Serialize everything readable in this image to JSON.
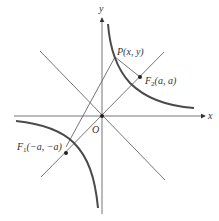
{
  "diagram": {
    "type": "hyperbola xy = c with foci on line y = x",
    "axes": {
      "x_label": "x",
      "y_label": "y",
      "origin_label": "O"
    },
    "points": {
      "P": {
        "label": "P(x,  y)"
      },
      "F2": {
        "name": "F",
        "subscript": "2",
        "coords": "(a,  a)"
      },
      "F1": {
        "name": "F",
        "subscript": "1",
        "coords": "(−a,  −a)"
      }
    },
    "lines": [
      "x-axis",
      "y-axis",
      "asymptote y = x",
      "line y = -x",
      "segment P-F1",
      "segment P-F2"
    ],
    "colors": {
      "curve": "#4a4a4a",
      "lines": "#666666",
      "text": "#333333"
    }
  }
}
